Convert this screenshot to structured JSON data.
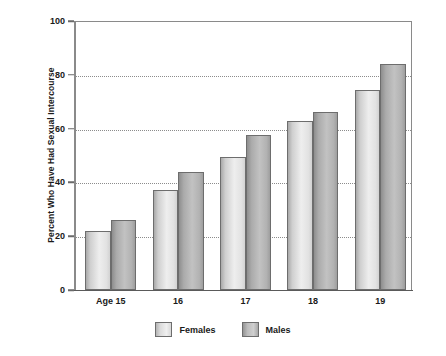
{
  "chart_data": {
    "type": "bar",
    "title": "",
    "xlabel": "",
    "ylabel": "Percent Who Have Had Sexual Intercourse",
    "categories": [
      "Age 15",
      "16",
      "17",
      "18",
      "19"
    ],
    "series": [
      {
        "name": "Females",
        "values": [
          22,
          37,
          49.5,
          63,
          74.5
        ]
      },
      {
        "name": "Males",
        "values": [
          26,
          44,
          57.5,
          66,
          84
        ]
      }
    ],
    "ylim": [
      0,
      100
    ],
    "yticks": [
      0,
      20,
      40,
      60,
      80,
      100
    ],
    "ytick_labels": [
      "0",
      "20",
      "40",
      "60",
      "80",
      "100"
    ],
    "gridlines": [
      20,
      40,
      60,
      80
    ],
    "grid": true,
    "legend_position": "bottom-center",
    "colors": {
      "females": "#e2e2e2",
      "males": "#b2b2b2",
      "bar_outline": "#6d6d6d",
      "gridline": "#8c8c8c",
      "axis": "#8a8a8a",
      "text": "#1a1a1a",
      "background": "#ffffff"
    }
  },
  "legend": {
    "items": [
      {
        "label": "Females",
        "swatch": "females-swatch"
      },
      {
        "label": "Males",
        "swatch": "males-swatch"
      }
    ]
  }
}
